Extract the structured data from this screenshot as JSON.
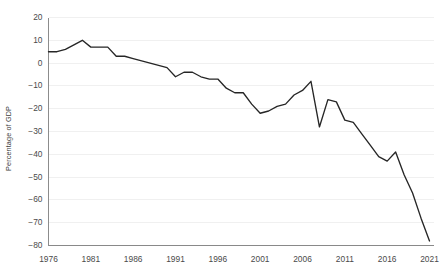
{
  "chart_data": {
    "type": "line",
    "title": "",
    "subtitle": "",
    "xlabel": "",
    "ylabel": "Percentage of GDP",
    "xlim": [
      1976,
      2021
    ],
    "ylim": [
      -80,
      20
    ],
    "ytick_step": 10,
    "xtick_step": 5,
    "grid": true,
    "grid_axis": "y",
    "legend": false,
    "legend_position": "none",
    "line_color": "#262626",
    "grid_color": "#e9e9ea",
    "axis_color": "#6f6f6f",
    "yticks": [
      20,
      10,
      0,
      -10,
      -20,
      -30,
      -40,
      -50,
      -60,
      -70,
      -80
    ],
    "ytick_labels": [
      "20",
      "10",
      "0",
      "−10",
      "−20",
      "−30",
      "−40",
      "−50",
      "−60",
      "−70",
      "−80"
    ],
    "xticks": [
      1976,
      1981,
      1986,
      1991,
      1996,
      2001,
      2006,
      2011,
      2016,
      2021
    ],
    "xtick_labels": [
      "1976",
      "1981",
      "1986",
      "1991",
      "1996",
      "2001",
      "2006",
      "2011",
      "2016",
      "2021"
    ],
    "series": [
      {
        "name": "Percentage of GDP",
        "x": [
          1976,
          1977,
          1978,
          1979,
          1980,
          1981,
          1982,
          1983,
          1984,
          1985,
          1986,
          1987,
          1988,
          1989,
          1990,
          1991,
          1992,
          1993,
          1994,
          1995,
          1996,
          1997,
          1998,
          1999,
          2000,
          2001,
          2002,
          2003,
          2004,
          2005,
          2006,
          2007,
          2008,
          2009,
          2010,
          2011,
          2012,
          2013,
          2014,
          2015,
          2016,
          2017,
          2018,
          2019,
          2020,
          2021
        ],
        "values": [
          5,
          5,
          6,
          8,
          10,
          7,
          7,
          7,
          7,
          4,
          3,
          3,
          2,
          1,
          0,
          -1,
          -2,
          -4,
          -6,
          -5,
          -6,
          -7,
          -7,
          -8,
          -6,
          -6,
          -7,
          -10,
          -13,
          -16,
          -20,
          -22,
          -21,
          -22,
          -21,
          -20,
          -16,
          -18,
          -22,
          -27,
          -28,
          -28,
          -29,
          -29,
          -29,
          -30
        ]
      }
    ],
    "series_detailed": {
      "note": "values read from the plotted polyline against the y-axis gridlines",
      "points": [
        {
          "year": 1976,
          "value": 5
        },
        {
          "year": 1977,
          "value": 5
        },
        {
          "year": 1978,
          "value": 6
        },
        {
          "year": 1979,
          "value": 8
        },
        {
          "year": 1980,
          "value": 10
        },
        {
          "year": 1981,
          "value": 7
        },
        {
          "year": 1982,
          "value": 7
        },
        {
          "year": 1983,
          "value": 7
        },
        {
          "year": 1984,
          "value": 3
        },
        {
          "year": 1985,
          "value": 3
        },
        {
          "year": 1986,
          "value": 2
        },
        {
          "year": 1987,
          "value": 1
        },
        {
          "year": 1988,
          "value": 0
        },
        {
          "year": 1989,
          "value": -1
        },
        {
          "year": 1990,
          "value": -2
        },
        {
          "year": 1991,
          "value": -6
        },
        {
          "year": 1992,
          "value": -4
        },
        {
          "year": 1993,
          "value": -4
        },
        {
          "year": 1994,
          "value": -6
        },
        {
          "year": 1995,
          "value": -7
        },
        {
          "year": 1996,
          "value": -7
        },
        {
          "year": 1997,
          "value": -11
        },
        {
          "year": 1998,
          "value": -13
        },
        {
          "year": 1999,
          "value": -13
        },
        {
          "year": 2000,
          "value": -18
        },
        {
          "year": 2001,
          "value": -22
        },
        {
          "year": 2002,
          "value": -21
        },
        {
          "year": 2003,
          "value": -19
        },
        {
          "year": 2004,
          "value": -18
        },
        {
          "year": 2005,
          "value": -14
        },
        {
          "year": 2006,
          "value": -12
        },
        {
          "year": 2007,
          "value": -8
        },
        {
          "year": 2008,
          "value": -28
        },
        {
          "year": 2009,
          "value": -16
        },
        {
          "year": 2010,
          "value": -17
        },
        {
          "year": 2011,
          "value": -25
        },
        {
          "year": 2012,
          "value": -26
        },
        {
          "year": 2013,
          "value": -31
        },
        {
          "year": 2014,
          "value": -36
        },
        {
          "year": 2015,
          "value": -41
        },
        {
          "year": 2016,
          "value": -43
        },
        {
          "year": 2017,
          "value": -39
        },
        {
          "year": 2018,
          "value": -49
        },
        {
          "year": 2019,
          "value": -57
        },
        {
          "year": 2020,
          "value": -68
        },
        {
          "year": 2021,
          "value": -78
        }
      ]
    }
  }
}
